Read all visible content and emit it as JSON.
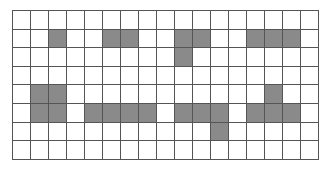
{
  "grid": {
    "rows": 8,
    "cols": 17,
    "fill_color": "#8a8a8a",
    "line_color": "#555555",
    "filled_cells": [
      [
        1,
        2
      ],
      [
        1,
        5
      ],
      [
        1,
        6
      ],
      [
        1,
        9
      ],
      [
        1,
        10
      ],
      [
        1,
        13
      ],
      [
        1,
        14
      ],
      [
        1,
        15
      ],
      [
        2,
        9
      ],
      [
        4,
        1
      ],
      [
        4,
        2
      ],
      [
        4,
        14
      ],
      [
        5,
        1
      ],
      [
        5,
        2
      ],
      [
        5,
        4
      ],
      [
        5,
        5
      ],
      [
        5,
        6
      ],
      [
        5,
        7
      ],
      [
        5,
        9
      ],
      [
        5,
        10
      ],
      [
        5,
        11
      ],
      [
        5,
        13
      ],
      [
        5,
        14
      ],
      [
        5,
        15
      ],
      [
        6,
        11
      ]
    ]
  }
}
